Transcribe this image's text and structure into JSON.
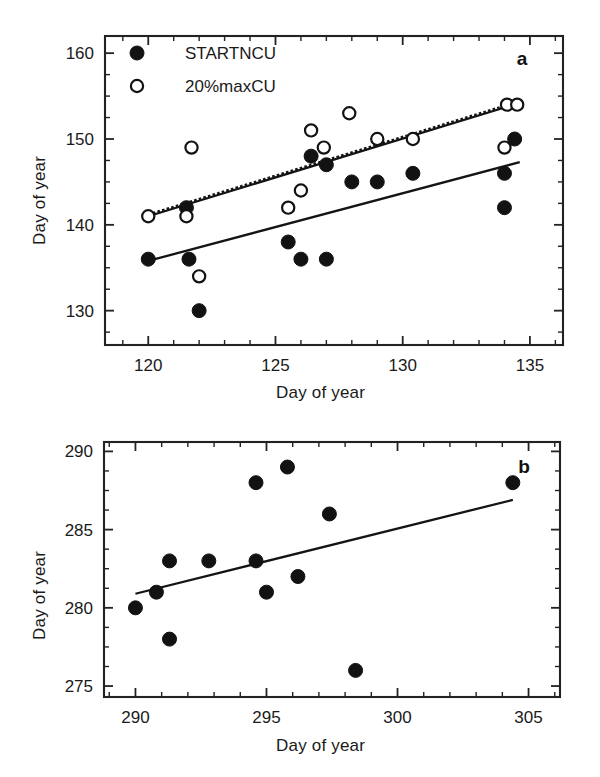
{
  "figure": {
    "background_color": "#ffffff",
    "ink_color": "#141414"
  },
  "panel_a": {
    "letter": "a",
    "xlabel": "Day of year",
    "ylabel": "Day of year",
    "x_ticks": [
      "120",
      "125",
      "130",
      "135"
    ],
    "y_ticks": [
      "130",
      "140",
      "150",
      "160"
    ],
    "legend": [
      {
        "marker": "filled-circle",
        "label": "STARTNCU"
      },
      {
        "marker": "open-circle",
        "label": "20%maxCU"
      }
    ]
  },
  "panel_b": {
    "letter": "b",
    "xlabel": "Day of year",
    "ylabel": "Day of year",
    "x_ticks": [
      "290",
      "295",
      "300",
      "305"
    ],
    "y_ticks": [
      "275",
      "280",
      "285",
      "290"
    ]
  },
  "chart_data": [
    {
      "type": "scatter",
      "panel": "a",
      "title": "",
      "xlabel": "Day of year",
      "ylabel": "Day of year",
      "xlim": [
        118.3,
        136.3
      ],
      "ylim": [
        126.0,
        162.0
      ],
      "xticks": [
        120,
        125,
        130,
        135
      ],
      "yticks": [
        130,
        140,
        150,
        160
      ],
      "xminor_step": 1,
      "yminor_step": 2.5,
      "grid": false,
      "legend_position": "top-left",
      "series": [
        {
          "name": "STARTNCU",
          "marker": "filled-circle",
          "points": [
            [
              120.0,
              136
            ],
            [
              121.5,
              142
            ],
            [
              121.6,
              136
            ],
            [
              122.0,
              130
            ],
            [
              125.5,
              138
            ],
            [
              126.0,
              136
            ],
            [
              126.4,
              148
            ],
            [
              127.0,
              147
            ],
            [
              127.0,
              136
            ],
            [
              128.0,
              145
            ],
            [
              129.0,
              145
            ],
            [
              130.4,
              146
            ],
            [
              134.0,
              146
            ],
            [
              134.0,
              142
            ],
            [
              134.4,
              150
            ]
          ]
        },
        {
          "name": "20%maxCU",
          "marker": "open-circle",
          "points": [
            [
              120.0,
              141
            ],
            [
              121.5,
              141
            ],
            [
              121.7,
              149
            ],
            [
              122.0,
              134
            ],
            [
              125.5,
              142
            ],
            [
              126.0,
              144
            ],
            [
              126.4,
              151
            ],
            [
              126.9,
              149
            ],
            [
              127.9,
              153
            ],
            [
              129.0,
              150
            ],
            [
              130.4,
              150
            ],
            [
              134.0,
              149
            ],
            [
              134.1,
              154
            ],
            [
              134.5,
              154
            ]
          ]
        }
      ],
      "fit_lines": [
        {
          "name": "20%maxCU-fit-solid",
          "style": "solid",
          "x": [
            120.0,
            134.6
          ],
          "y": [
            141.0,
            154.2
          ]
        },
        {
          "name": "20%maxCU-fit-dotted",
          "style": "dotted",
          "x": [
            120.0,
            134.6
          ],
          "y": [
            141.2,
            154.4
          ]
        },
        {
          "name": "STARTNCU-fit",
          "style": "solid",
          "x": [
            120.0,
            134.6
          ],
          "y": [
            135.8,
            147.3
          ]
        }
      ]
    },
    {
      "type": "scatter",
      "panel": "b",
      "title": "",
      "xlabel": "Day of year",
      "ylabel": "Day of year",
      "xlim": [
        288.8,
        306.2
      ],
      "ylim": [
        274.3,
        290.6
      ],
      "xticks": [
        290,
        295,
        300,
        305
      ],
      "yticks": [
        275,
        280,
        285,
        290
      ],
      "xminor_step": 1,
      "yminor_step": 1.25,
      "grid": false,
      "legend_position": "none",
      "series": [
        {
          "name": "STARTNCU",
          "marker": "filled-circle",
          "points": [
            [
              290.0,
              280
            ],
            [
              290.8,
              281
            ],
            [
              291.3,
              283
            ],
            [
              291.3,
              278
            ],
            [
              292.8,
              283
            ],
            [
              294.6,
              283
            ],
            [
              294.6,
              288
            ],
            [
              295.0,
              281
            ],
            [
              295.8,
              289
            ],
            [
              296.2,
              282
            ],
            [
              297.4,
              286
            ],
            [
              298.4,
              276
            ],
            [
              304.4,
              288
            ]
          ]
        }
      ],
      "fit_lines": [
        {
          "name": "STARTNCU-fit",
          "style": "solid",
          "x": [
            290.0,
            304.4
          ],
          "y": [
            280.9,
            286.9
          ]
        }
      ]
    }
  ]
}
